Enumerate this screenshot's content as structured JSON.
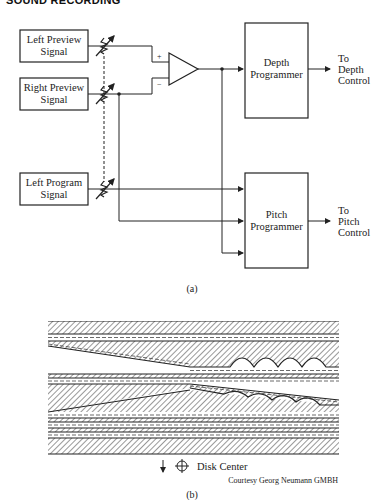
{
  "header": {
    "running_title": "SOUND RECORDING"
  },
  "figure_a": {
    "caption": "(a)",
    "inputs": [
      {
        "line1": "Left Preview",
        "line2": "Signal"
      },
      {
        "line1": "Right Preview",
        "line2": "Signal"
      },
      {
        "line1": "Left Program",
        "line2": "Signal"
      }
    ],
    "amplifier": {
      "plus": "+",
      "minus": "−"
    },
    "blocks": [
      {
        "line1": "Depth",
        "line2": "Programmer",
        "out1": "To",
        "out2": "Depth",
        "out3": "Control"
      },
      {
        "line1": "Pitch",
        "line2": "Programmer",
        "out1": "To",
        "out2": "Pitch",
        "out3": "Control"
      }
    ]
  },
  "figure_b": {
    "caption": "(b)",
    "disk_center_label": "Disk Center",
    "credit": "Courtesy Georg Neumann GMBH"
  }
}
